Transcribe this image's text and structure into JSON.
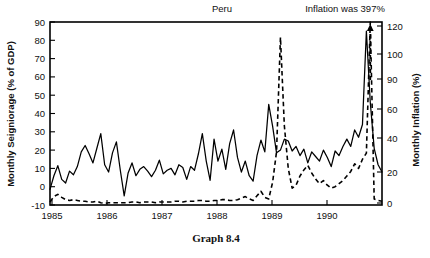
{
  "figure": {
    "caption": "Graph 8.4",
    "background_color": "#ffffff",
    "line_color": "#000000"
  },
  "chart_data": {
    "type": "line",
    "title": "Peru",
    "xlabel": "",
    "grid": false,
    "legend": "none",
    "annotations": [
      {
        "text": "Peru",
        "x_position_fraction": 0.52,
        "role": "country-label"
      },
      {
        "text": "Inflation was 397%",
        "x_position_fraction": 0.86,
        "role": "offscale-note"
      }
    ],
    "x": {
      "tick_labels": [
        "1985",
        "1986",
        "1987",
        "1988",
        "1989",
        "1990"
      ],
      "range_start": 1985.0,
      "range_end": 1990.92
    },
    "axis_left": {
      "label": "Monthly Seigniorage (% of GDP)",
      "tick_labels": [
        "90",
        "80",
        "70",
        "60",
        "50",
        "40",
        "30",
        "20",
        "10",
        "0",
        "-10"
      ],
      "ticks": [
        90,
        80,
        70,
        60,
        50,
        40,
        30,
        20,
        10,
        0,
        -10
      ],
      "ylim": [
        -10,
        90
      ]
    },
    "axis_right": {
      "label": "Monthly Inflation (%)",
      "tick_labels": [
        "120",
        "100",
        "90",
        "60",
        "40",
        "20",
        "0"
      ],
      "ticks": [
        120,
        100,
        90,
        60,
        40,
        20,
        0
      ],
      "ylim": [
        0,
        120
      ]
    },
    "series": [
      {
        "name": "Monthly Seigniorage (% of GDP)",
        "axis": "left",
        "style": "solid",
        "values": [
          -1.5,
          6.0,
          11.5,
          4.0,
          2.0,
          8.5,
          6.5,
          11.0,
          19.0,
          22.5,
          18.0,
          13.0,
          21.0,
          29.0,
          12.0,
          8.0,
          18.5,
          24.5,
          9.0,
          -5.0,
          7.5,
          13.0,
          6.0,
          9.5,
          11.0,
          8.5,
          5.5,
          9.0,
          14.5,
          7.0,
          9.0,
          10.0,
          6.5,
          12.0,
          10.5,
          4.0,
          11.0,
          9.0,
          18.0,
          29.0,
          14.0,
          3.5,
          26.0,
          14.0,
          20.5,
          9.5,
          23.5,
          31.0,
          16.0,
          8.0,
          14.0,
          6.0,
          3.0,
          17.0,
          25.5,
          19.0,
          45.0,
          33.0,
          18.5,
          20.0,
          26.0,
          25.0,
          19.5,
          22.0,
          17.0,
          20.5,
          13.0,
          19.0,
          16.5,
          14.0,
          20.0,
          16.0,
          11.0,
          19.5,
          17.0,
          22.0,
          26.0,
          22.0,
          31.0,
          27.0,
          34.0,
          85.0,
          46.0,
          21.0,
          12.0,
          8.0
        ]
      },
      {
        "name": "Monthly Inflation (%)",
        "axis": "right",
        "style": "dashed",
        "values": [
          2.0,
          5.5,
          7.0,
          5.0,
          3.5,
          3.0,
          3.5,
          3.0,
          2.5,
          2.5,
          2.0,
          2.0,
          2.5,
          1.5,
          1.0,
          1.5,
          1.5,
          1.5,
          1.5,
          1.5,
          1.5,
          2.0,
          2.0,
          1.5,
          2.0,
          2.0,
          2.0,
          1.5,
          2.0,
          2.0,
          2.0,
          2.0,
          2.5,
          2.5,
          2.0,
          2.5,
          2.5,
          2.5,
          3.0,
          3.0,
          2.5,
          2.5,
          3.0,
          3.0,
          3.5,
          3.5,
          3.0,
          3.0,
          3.5,
          4.5,
          5.5,
          4.0,
          3.0,
          6.0,
          9.0,
          5.0,
          4.0,
          15.0,
          35.0,
          110.0,
          52.0,
          24.0,
          11.0,
          13.0,
          19.0,
          23.0,
          26.0,
          21.0,
          17.0,
          14.0,
          16.0,
          13.0,
          11.0,
          12.0,
          14.0,
          16.0,
          19.0,
          22.0,
          27.0,
          24.0,
          30.0,
          34.0,
          120.0,
          4.0,
          3.0,
          2.5
        ],
        "offscale_note": "Inflation was 397%",
        "offscale_arrow": true
      }
    ]
  }
}
